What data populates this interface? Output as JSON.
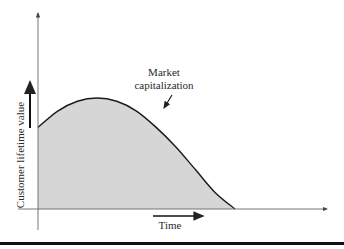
{
  "chart_data": {
    "type": "area",
    "title": "",
    "xlabel": "Time",
    "ylabel": "Customer lifetime value",
    "annotation": {
      "lines": [
        "Market",
        "capitalization"
      ]
    },
    "series": [
      {
        "name": "Market capitalization",
        "x": [
          0,
          0.1,
          0.2,
          0.3,
          0.4,
          0.5,
          0.6,
          0.7,
          0.8,
          0.9,
          1.0
        ],
        "y": [
          0.5,
          0.6,
          0.66,
          0.68,
          0.66,
          0.6,
          0.5,
          0.38,
          0.24,
          0.1,
          0
        ]
      }
    ],
    "xlim": [
      0,
      1.45
    ],
    "ylim": [
      0,
      1.5
    ],
    "grid": false,
    "colors": {
      "fill": "#d6d6d6",
      "line": "#1a1a1a",
      "axis": "#555555"
    }
  }
}
